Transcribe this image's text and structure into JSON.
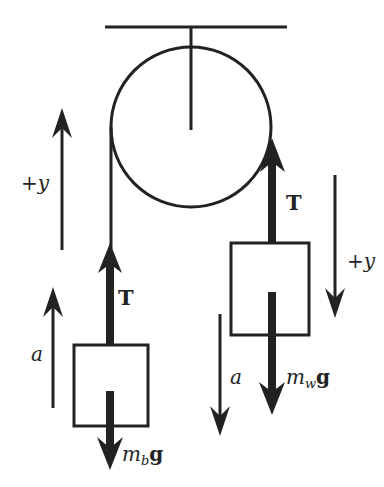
{
  "diagram": {
    "colors": {
      "ink": "#222222",
      "background": "#ffffff"
    },
    "labels": {
      "left_positive_y": "+y",
      "left_acceleration": "a",
      "left_tension": "T",
      "left_weight_m": "m",
      "left_weight_sub": "b",
      "left_weight_g": "g",
      "right_positive_y": "+y",
      "right_acceleration": "a",
      "right_tension": "T",
      "right_weight_m": "m",
      "right_weight_sub": "w",
      "right_weight_g": "g"
    },
    "components": [
      {
        "name": "ceiling",
        "kind": "support"
      },
      {
        "name": "pulley",
        "kind": "wheel"
      },
      {
        "name": "left-mass",
        "kind": "block",
        "force_up": "T",
        "force_down": "m_b g",
        "acceleration": "up"
      },
      {
        "name": "right-mass",
        "kind": "block",
        "force_up": "T",
        "force_down": "m_w g",
        "acceleration": "down"
      }
    ]
  }
}
